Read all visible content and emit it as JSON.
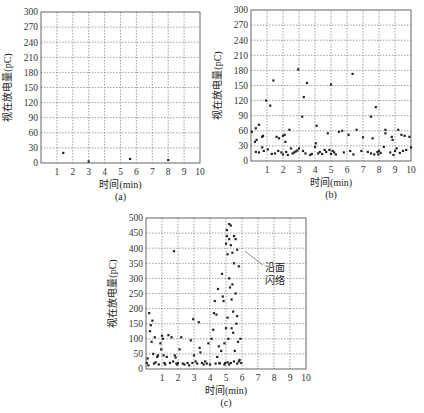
{
  "chart_data": [
    {
      "id": "a",
      "type": "scatter",
      "subtitle": "(a)",
      "xlabel": "时间(min)",
      "ylabel": "视在放电量(pC)",
      "xlim": [
        0,
        10
      ],
      "ylim": [
        0,
        300
      ],
      "xticks": [
        1,
        2,
        3,
        4,
        5,
        6,
        7,
        8,
        9,
        10
      ],
      "yticks": [
        0,
        30,
        60,
        90,
        120,
        150,
        180,
        210,
        240,
        270,
        300
      ],
      "grid": true,
      "box": {
        "left": 41,
        "right": 200,
        "top": 12,
        "bottom": 163
      },
      "points": [
        [
          1.4,
          20
        ],
        [
          3.0,
          3
        ],
        [
          5.6,
          8
        ],
        [
          8.0,
          6
        ]
      ]
    },
    {
      "id": "b",
      "type": "scatter",
      "subtitle": "(b)",
      "xlabel": "时间(min)",
      "ylabel": "视在放电量(pC)",
      "xlim": [
        0,
        10
      ],
      "ylim": [
        0,
        300
      ],
      "xticks": [
        1,
        2,
        3,
        4,
        5,
        6,
        7,
        8,
        9,
        10
      ],
      "yticks": [
        0,
        30,
        60,
        90,
        120,
        150,
        180,
        210,
        240,
        270,
        300
      ],
      "grid": true,
      "box": {
        "left": 251,
        "right": 411,
        "top": 10,
        "bottom": 161
      },
      "points": [
        [
          0.05,
          58
        ],
        [
          0.25,
          38
        ],
        [
          0.3,
          65
        ],
        [
          0.35,
          42
        ],
        [
          0.5,
          72
        ],
        [
          0.7,
          48
        ],
        [
          0.75,
          50
        ],
        [
          0.7,
          27
        ],
        [
          0.3,
          18
        ],
        [
          0.5,
          17
        ],
        [
          0.8,
          20
        ],
        [
          0.95,
          120
        ],
        [
          1.05,
          23
        ],
        [
          1.2,
          110
        ],
        [
          1.4,
          160
        ],
        [
          1.3,
          14
        ],
        [
          1.5,
          15
        ],
        [
          1.6,
          48
        ],
        [
          1.7,
          20
        ],
        [
          1.75,
          45
        ],
        [
          1.9,
          17
        ],
        [
          2.0,
          13
        ],
        [
          2.0,
          50
        ],
        [
          2.1,
          52
        ],
        [
          2.15,
          38
        ],
        [
          2.2,
          18
        ],
        [
          2.3,
          12
        ],
        [
          2.4,
          62
        ],
        [
          2.5,
          25
        ],
        [
          2.6,
          15
        ],
        [
          2.7,
          17
        ],
        [
          2.8,
          19
        ],
        [
          2.9,
          21
        ],
        [
          2.95,
          182
        ],
        [
          3.0,
          25
        ],
        [
          3.2,
          88
        ],
        [
          3.25,
          20
        ],
        [
          3.3,
          127
        ],
        [
          3.5,
          155
        ],
        [
          3.4,
          15
        ],
        [
          3.7,
          12
        ],
        [
          3.8,
          14
        ],
        [
          4.0,
          28
        ],
        [
          4.05,
          35
        ],
        [
          4.1,
          70
        ],
        [
          4.2,
          15
        ],
        [
          4.3,
          18
        ],
        [
          4.45,
          14
        ],
        [
          4.6,
          22
        ],
        [
          4.7,
          18
        ],
        [
          4.8,
          55
        ],
        [
          4.9,
          22
        ],
        [
          5.0,
          152
        ],
        [
          5.0,
          14
        ],
        [
          5.1,
          20
        ],
        [
          5.2,
          17
        ],
        [
          5.3,
          13
        ],
        [
          5.5,
          58
        ],
        [
          5.7,
          60
        ],
        [
          5.8,
          17
        ],
        [
          6.1,
          52
        ],
        [
          6.2,
          20
        ],
        [
          6.35,
          173
        ],
        [
          6.4,
          13
        ],
        [
          6.6,
          62
        ],
        [
          6.9,
          20
        ],
        [
          7.0,
          47
        ],
        [
          7.3,
          18
        ],
        [
          7.5,
          88
        ],
        [
          7.6,
          45
        ],
        [
          7.5,
          15
        ],
        [
          7.7,
          13
        ],
        [
          7.8,
          107
        ],
        [
          7.9,
          18
        ],
        [
          7.95,
          13
        ],
        [
          8.0,
          20
        ],
        [
          8.1,
          16
        ],
        [
          8.3,
          28
        ],
        [
          8.4,
          55
        ],
        [
          8.4,
          62
        ],
        [
          8.7,
          17
        ],
        [
          8.8,
          48
        ],
        [
          8.85,
          42
        ],
        [
          8.9,
          12
        ],
        [
          9.0,
          20
        ],
        [
          9.1,
          25
        ],
        [
          9.2,
          62
        ],
        [
          9.3,
          16
        ],
        [
          9.4,
          52
        ],
        [
          9.5,
          20
        ],
        [
          9.6,
          50
        ],
        [
          9.7,
          22
        ],
        [
          9.9,
          48
        ],
        [
          10.0,
          27
        ]
      ]
    },
    {
      "id": "c",
      "type": "scatter",
      "subtitle": "(c)",
      "xlabel": "时间(min)",
      "ylabel": "视在放电量(pC)",
      "xlim": [
        0,
        10
      ],
      "ylim": [
        0,
        500
      ],
      "xticks": [
        1,
        2,
        3,
        4,
        5,
        6,
        7,
        8,
        9,
        10
      ],
      "yticks": [
        0,
        50,
        100,
        150,
        200,
        250,
        300,
        350,
        400,
        450,
        500
      ],
      "grid": true,
      "annotation": {
        "text_line1": "沿面",
        "text_line2": "闪络",
        "points_to": [
          6.0,
          390
        ]
      },
      "box": {
        "left": 146,
        "right": 306,
        "top": 218,
        "bottom": 369
      },
      "points": [
        [
          0.05,
          20
        ],
        [
          0.1,
          35
        ],
        [
          0.15,
          12
        ],
        [
          0.2,
          185
        ],
        [
          0.25,
          125
        ],
        [
          0.3,
          145
        ],
        [
          0.35,
          90
        ],
        [
          0.4,
          160
        ],
        [
          0.45,
          50
        ],
        [
          0.5,
          18
        ],
        [
          0.55,
          105
        ],
        [
          0.6,
          22
        ],
        [
          0.7,
          40
        ],
        [
          0.75,
          45
        ],
        [
          0.8,
          15
        ],
        [
          0.9,
          85
        ],
        [
          0.95,
          65
        ],
        [
          1.0,
          110
        ],
        [
          1.05,
          100
        ],
        [
          1.1,
          45
        ],
        [
          1.15,
          20
        ],
        [
          1.2,
          15
        ],
        [
          1.3,
          40
        ],
        [
          1.4,
          112
        ],
        [
          1.5,
          20
        ],
        [
          1.6,
          105
        ],
        [
          1.7,
          25
        ],
        [
          1.75,
          390
        ],
        [
          1.8,
          45
        ],
        [
          1.85,
          38
        ],
        [
          1.9,
          18
        ],
        [
          1.95,
          15
        ],
        [
          2.0,
          20
        ],
        [
          2.1,
          65
        ],
        [
          2.2,
          105
        ],
        [
          2.3,
          18
        ],
        [
          2.4,
          15
        ],
        [
          2.6,
          20
        ],
        [
          2.7,
          12
        ],
        [
          2.8,
          95
        ],
        [
          2.9,
          20
        ],
        [
          2.95,
          165
        ],
        [
          3.0,
          45
        ],
        [
          3.1,
          25
        ],
        [
          3.2,
          18
        ],
        [
          3.3,
          155
        ],
        [
          3.35,
          70
        ],
        [
          3.4,
          55
        ],
        [
          3.5,
          20
        ],
        [
          3.6,
          15
        ],
        [
          3.7,
          25
        ],
        [
          3.8,
          18
        ],
        [
          3.9,
          85
        ],
        [
          4.0,
          15
        ],
        [
          4.1,
          100
        ],
        [
          4.2,
          130
        ],
        [
          4.25,
          185
        ],
        [
          4.3,
          225
        ],
        [
          4.35,
          18
        ],
        [
          4.4,
          180
        ],
        [
          4.45,
          40
        ],
        [
          4.5,
          265
        ],
        [
          4.55,
          75
        ],
        [
          4.6,
          20
        ],
        [
          4.7,
          60
        ],
        [
          4.75,
          315
        ],
        [
          4.8,
          240
        ],
        [
          4.85,
          225
        ],
        [
          4.9,
          85
        ],
        [
          4.95,
          20
        ],
        [
          5.0,
          415
        ],
        [
          5.0,
          135
        ],
        [
          5.05,
          460
        ],
        [
          5.05,
          440
        ],
        [
          5.1,
          380
        ],
        [
          5.1,
          170
        ],
        [
          5.15,
          100
        ],
        [
          5.2,
          480
        ],
        [
          5.2,
          430
        ],
        [
          5.2,
          300
        ],
        [
          5.25,
          270
        ],
        [
          5.3,
          475
        ],
        [
          5.3,
          410
        ],
        [
          5.35,
          230
        ],
        [
          5.35,
          135
        ],
        [
          5.4,
          385
        ],
        [
          5.4,
          280
        ],
        [
          5.45,
          190
        ],
        [
          5.45,
          120
        ],
        [
          5.5,
          440
        ],
        [
          5.5,
          350
        ],
        [
          5.55,
          60
        ],
        [
          5.6,
          430
        ],
        [
          5.6,
          250
        ],
        [
          5.65,
          150
        ],
        [
          5.7,
          395
        ],
        [
          5.7,
          175
        ],
        [
          5.75,
          90
        ],
        [
          5.8,
          340
        ],
        [
          5.8,
          25
        ],
        [
          5.85,
          30
        ],
        [
          5.9,
          100
        ],
        [
          5.95,
          20
        ],
        [
          5.5,
          25
        ],
        [
          5.3,
          20
        ],
        [
          5.1,
          22
        ],
        [
          4.9,
          15
        ],
        [
          4.6,
          18
        ],
        [
          5.2,
          15
        ],
        [
          5.7,
          18
        ]
      ]
    }
  ]
}
